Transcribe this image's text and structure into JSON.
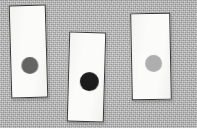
{
  "scene": {
    "title": "Three white cards with gray dots on textured gray background",
    "background_color": "#b8b8b8",
    "background_texture": "noisy-gray-fabric",
    "card_fill_color": "#fbfbfa",
    "card_border_color": "#2c2c2c",
    "alt_text": "Three upright white rectangular cards lie on a mottled gray surface. Each card bears a single filled circle; from left to right the circles are medium-dark gray, black, and light gray."
  },
  "cards": [
    {
      "id": "card-1",
      "label": "left-card",
      "dot": {
        "name": "dark-gray-dot",
        "color": "#5a5a5a",
        "shade": "dark gray"
      }
    },
    {
      "id": "card-2",
      "label": "middle-card",
      "dot": {
        "name": "black-dot",
        "color": "#0a0a0a",
        "shade": "black"
      }
    },
    {
      "id": "card-3",
      "label": "right-card",
      "dot": {
        "name": "light-gray-dot",
        "color": "#a9a9a9",
        "shade": "light gray"
      }
    }
  ]
}
